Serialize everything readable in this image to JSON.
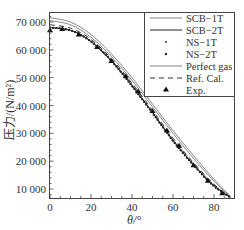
{
  "chart_data": {
    "type": "line",
    "title": "",
    "xlabel": "θ/°",
    "ylabel": "压力/(N/m²)",
    "xlim": [
      0,
      90
    ],
    "ylim": [
      6700,
      73600
    ],
    "xticks": [
      0,
      20,
      40,
      60,
      80
    ],
    "xtick_labels": [
      "0",
      "20",
      "40",
      "60",
      "80"
    ],
    "yticks": [
      10000,
      20000,
      30000,
      40000,
      50000,
      60000,
      70000
    ],
    "ytick_labels": [
      "10 000",
      "20 000",
      "30 000",
      "40 000",
      "50 000",
      "60 000",
      "70 000"
    ],
    "grid": false,
    "legend_position": "upper right",
    "x": [
      0,
      10,
      20,
      30,
      40,
      50,
      60,
      70,
      80,
      88
    ],
    "series": [
      {
        "name": "SCB−1T",
        "style": "solid-thin",
        "values": [
          70500,
          69000,
          64500,
          57500,
          49000,
          39500,
          30000,
          21000,
          12800,
          7200
        ]
      },
      {
        "name": "SCB−2T",
        "style": "solid",
        "values": [
          68000,
          67000,
          63000,
          56000,
          47200,
          37500,
          27500,
          18800,
          11200,
          7000
        ]
      },
      {
        "name": "NS−1T",
        "style": "dots",
        "values": [
          68000,
          67000,
          63000,
          56000,
          47000,
          37300,
          27300,
          18600,
          11000,
          7000
        ]
      },
      {
        "name": "NS−2T",
        "style": "dots",
        "values": [
          68000,
          67000,
          63000,
          56000,
          47000,
          37300,
          27300,
          18600,
          11000,
          7000
        ]
      },
      {
        "name": "Perfect gas",
        "style": "solid-thin",
        "values": [
          71500,
          70000,
          65500,
          58500,
          50000,
          40500,
          31000,
          22000,
          13500,
          7400
        ]
      },
      {
        "name": "Ref. Cal.",
        "style": "dashed",
        "values": [
          69000,
          67800,
          63800,
          56800,
          48000,
          38300,
          28300,
          19500,
          11700,
          7100
        ]
      },
      {
        "name": "Exp.",
        "style": "triangle-markers",
        "x": [
          0,
          6,
          14,
          23,
          30,
          37,
          43,
          50,
          57,
          63,
          70,
          77,
          84
        ],
        "values": [
          67000,
          67500,
          65500,
          61000,
          56000,
          50500,
          45000,
          38000,
          31000,
          25500,
          18500,
          13000,
          8500
        ]
      }
    ]
  },
  "legend": {
    "items": [
      {
        "label": "SCB−1T"
      },
      {
        "label": "SCB−2T"
      },
      {
        "label": "NS−1T"
      },
      {
        "label": "NS−2T"
      },
      {
        "label": "Perfect gas"
      },
      {
        "label": "Ref. Cal."
      },
      {
        "label": "Exp."
      }
    ]
  },
  "axes": {
    "xlabel": "θ/°",
    "ylabel": "压力/(N/m²)",
    "yticks": [
      "70 000",
      "60 000",
      "50 000",
      "40 000",
      "30 000",
      "20 000",
      "10 000"
    ],
    "xticks": [
      "0",
      "20",
      "40",
      "60",
      "80"
    ]
  },
  "colors": {
    "line": "#333333",
    "axis": "#444444",
    "thin_line": "#666666"
  }
}
